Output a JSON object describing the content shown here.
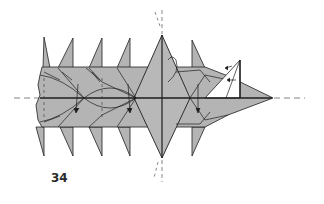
{
  "diagram": {
    "step_number": "34",
    "colors": {
      "paper_fill": "#b4b4b4",
      "paper_fill_light": "#bdbdbd",
      "line": "#1e1e1e",
      "dashed_line": "#555555",
      "background": "#ffffff",
      "flap_fill": "#ffffff"
    },
    "elements": {
      "horizontal_axis": "dashed center line (valley fold reference)",
      "vertical_axis": "dashed line through central spike",
      "spikes_top": 5,
      "spikes_bottom": 5,
      "central_diamond": "large central spike",
      "head_point": "pointed tip on the right",
      "white_flap": "triangular flap lifted at right with arrows",
      "arrows": [
        "fold-down arrow left",
        "fold-down arrow middle",
        "fold-down arrow right",
        "curl arrow at central spike",
        "flap arrows x2"
      ]
    }
  }
}
